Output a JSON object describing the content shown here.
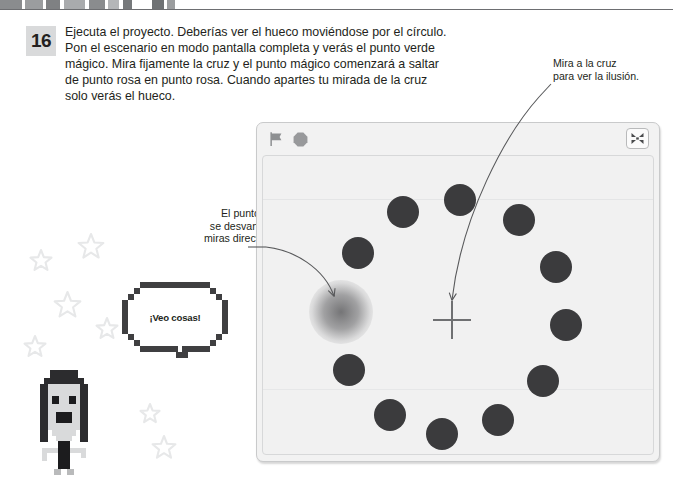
{
  "page": {
    "background": "#ffffff",
    "text_color": "#231f20"
  },
  "step": {
    "number": "16",
    "lines": [
      "Ejecuta el proyecto. Deberías ver el hueco moviéndose por el círculo.",
      "Pon el escenario en modo pantalla completa y verás el punto verde",
      "mágico. Mira fijamente la cruz y el punto mágico comenzará a saltar",
      "de punto rosa en punto rosa. Cuando apartes tu mirada de la cruz",
      "solo verás el hueco."
    ]
  },
  "callouts": {
    "right": {
      "lines": [
        "Mira a la cruz",
        "para ver la ilusión."
      ],
      "target": "cross"
    },
    "left": {
      "lines": [
        "El punto mágico",
        "se desvanece si lo",
        "miras directamente."
      ],
      "target": "fuzzy-dot"
    }
  },
  "speech_bubble": {
    "text": "¡Veo cosas!"
  },
  "stage": {
    "toolbar": {
      "green_flag_label": "green-flag",
      "stop_label": "stop",
      "fullscreen_label": "fullscreen-toggle"
    },
    "colors": {
      "window_bg": "#f2f2f2",
      "stage_bg": "#f1f1f1",
      "dot": "#3b3b3d",
      "cross": "#6f7072",
      "flag": "#8e9092",
      "stop": "#98999b"
    },
    "cross": {
      "cx": 452,
      "cy": 320,
      "arm": 19
    },
    "dots": [
      {
        "cx": 460,
        "cy": 200,
        "r": 16,
        "kind": "solid",
        "name": "dot-12"
      },
      {
        "cx": 519,
        "cy": 220,
        "r": 16,
        "kind": "solid",
        "name": "dot-1"
      },
      {
        "cx": 556,
        "cy": 267,
        "r": 16,
        "kind": "solid",
        "name": "dot-2"
      },
      {
        "cx": 566,
        "cy": 325,
        "r": 16,
        "kind": "solid",
        "name": "dot-3"
      },
      {
        "cx": 543,
        "cy": 381,
        "r": 16,
        "kind": "solid",
        "name": "dot-4"
      },
      {
        "cx": 498,
        "cy": 420,
        "r": 16,
        "kind": "solid",
        "name": "dot-5"
      },
      {
        "cx": 442,
        "cy": 434,
        "r": 16,
        "kind": "solid",
        "name": "dot-6"
      },
      {
        "cx": 390,
        "cy": 415,
        "r": 16,
        "kind": "solid",
        "name": "dot-7"
      },
      {
        "cx": 349,
        "cy": 370,
        "r": 16,
        "kind": "solid",
        "name": "dot-8"
      },
      {
        "cx": 341,
        "cy": 312,
        "r": 17,
        "kind": "fuzzy",
        "name": "dot-9-magic"
      },
      {
        "cx": 358,
        "cy": 253,
        "r": 16,
        "kind": "solid",
        "name": "dot-10"
      },
      {
        "cx": 403,
        "cy": 212,
        "r": 16,
        "kind": "solid",
        "name": "dot-11"
      }
    ]
  },
  "decor": {
    "stars": [
      {
        "x": 30,
        "y": 250,
        "s": 22
      },
      {
        "x": 78,
        "y": 234,
        "s": 26
      },
      {
        "x": 54,
        "y": 292,
        "s": 27
      },
      {
        "x": 24,
        "y": 336,
        "s": 22
      },
      {
        "x": 96,
        "y": 318,
        "s": 22
      },
      {
        "x": 140,
        "y": 404,
        "s": 20
      },
      {
        "x": 152,
        "y": 436,
        "s": 24
      }
    ],
    "top_dashes": [
      {
        "x": 0,
        "w": 22,
        "c": "#8a8c8e"
      },
      {
        "x": 25,
        "w": 18,
        "c": "#9b9d9f"
      },
      {
        "x": 46,
        "w": 14,
        "c": "#7f8183"
      },
      {
        "x": 64,
        "w": 21,
        "c": "#a9abad"
      },
      {
        "x": 89,
        "w": 16,
        "c": "#8a8c8e"
      },
      {
        "x": 108,
        "w": 11,
        "c": "#b4b6b8"
      },
      {
        "x": 123,
        "w": 9,
        "c": "#76797b"
      },
      {
        "x": 135,
        "w": 14,
        "c": "#ffffff"
      },
      {
        "x": 152,
        "w": 12,
        "c": "#6f7274"
      },
      {
        "x": 167,
        "w": 8,
        "c": "#9b9d9f"
      }
    ]
  }
}
